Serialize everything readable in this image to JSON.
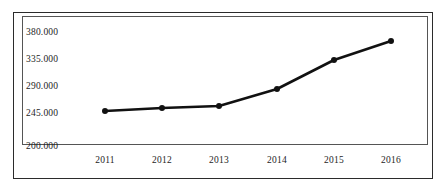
{
  "chart_data": {
    "type": "line",
    "title": "",
    "subtitle": "",
    "xlabel": "",
    "ylabel": "",
    "grid": false,
    "legend": null,
    "categories": [
      "2011",
      "2012",
      "2013",
      "2014",
      "2015",
      "2016"
    ],
    "x": [
      2011,
      2012,
      2013,
      2014,
      2015,
      2016
    ],
    "values": [
      255000,
      262000,
      266000,
      292000,
      338000,
      367000
    ],
    "series": [
      {
        "name": "",
        "values": [
          255000,
          262000,
          266000,
          292000,
          338000,
          367000
        ],
        "color": "#111111",
        "marker": "circle",
        "line_width": 2.6
      }
    ],
    "ytick_labels": [
      "380.000",
      "335.000",
      "290.000",
      "245.000",
      "200.000"
    ],
    "ytick_values": [
      380000,
      335000,
      290000,
      245000,
      200000
    ],
    "ylim": [
      200000,
      380000
    ],
    "xtick_labels": [
      "2011",
      "2012",
      "2013",
      "2014",
      "2015",
      "2016"
    ],
    "axis_color": "#555555",
    "frame_color": "#2b2b2b",
    "background": "#ffffff"
  },
  "axes": {
    "y_labels": [
      {
        "text": "380.000",
        "top": 27
      },
      {
        "text": "335.000",
        "top": 54
      },
      {
        "text": "290.000",
        "top": 81
      },
      {
        "text": "245.000",
        "top": 108
      },
      {
        "text": "200.000",
        "top": 141
      }
    ],
    "x_labels": [
      {
        "text": "2011",
        "left": 82
      },
      {
        "text": "2012",
        "left": 139
      },
      {
        "text": "2013",
        "left": 196
      },
      {
        "text": "2014",
        "left": 254
      },
      {
        "text": "2015",
        "left": 311
      },
      {
        "text": "2016",
        "left": 368
      }
    ]
  },
  "points": [
    {
      "cx": 105,
      "cy": 111,
      "label": "2011"
    },
    {
      "cx": 162,
      "cy": 108,
      "label": "2012"
    },
    {
      "cx": 219,
      "cy": 106,
      "label": "2013"
    },
    {
      "cx": 277,
      "cy": 89,
      "label": "2014"
    },
    {
      "cx": 334,
      "cy": 60,
      "label": "2015"
    },
    {
      "cx": 391,
      "cy": 41,
      "label": "2016"
    }
  ],
  "polyline": "105,111 162,108 219,106 277,89 334,60 391,41"
}
